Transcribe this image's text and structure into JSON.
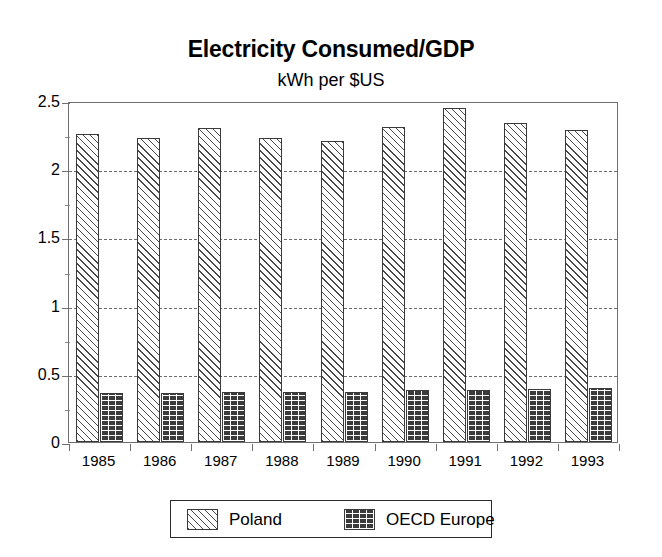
{
  "chart_data": {
    "type": "bar",
    "title": "Electricity Consumed/GDP",
    "subtitle": "kWh per $US",
    "xlabel": "",
    "ylabel": "",
    "ylim": [
      0,
      2.5
    ],
    "ytick_labels": [
      "0",
      "0.5",
      "1",
      "1.5",
      "2",
      "2.5"
    ],
    "ytick_values": [
      0,
      0.5,
      1,
      1.5,
      2,
      2.5
    ],
    "yminor_values": [
      0.25,
      0.75,
      1.25,
      1.75,
      2.25
    ],
    "grid": true,
    "grid_style": "dashed-horizontal",
    "legend_position": "bottom-center",
    "categories": [
      "1985",
      "1986",
      "1987",
      "1988",
      "1989",
      "1990",
      "1991",
      "1992",
      "1993"
    ],
    "series": [
      {
        "name": "Poland",
        "pattern": "diagonal-hatch",
        "color": "#ffffff",
        "values": [
          2.26,
          2.23,
          2.3,
          2.23,
          2.21,
          2.31,
          2.45,
          2.34,
          2.29
        ]
      },
      {
        "name": "OECD Europe",
        "pattern": "brick-hatch",
        "color": "#3b3b3b",
        "values": [
          0.36,
          0.36,
          0.37,
          0.37,
          0.37,
          0.38,
          0.385,
          0.39,
          0.395
        ]
      }
    ]
  },
  "legend": {
    "items": [
      {
        "label": "Poland"
      },
      {
        "label": "OECD Europe"
      }
    ]
  }
}
